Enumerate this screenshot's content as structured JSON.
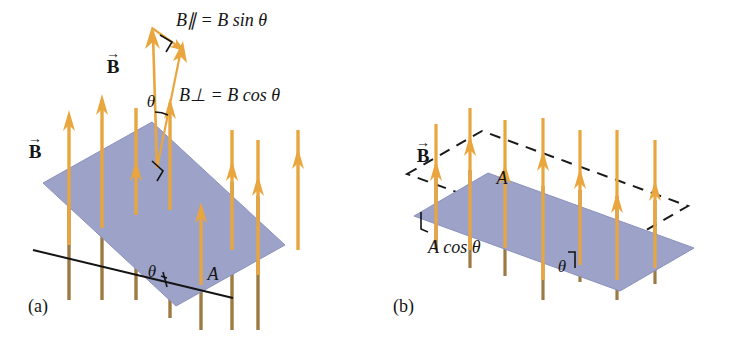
{
  "figure": {
    "background_color": "#ffffff",
    "panels": [
      {
        "id": "a",
        "caption": "(a)",
        "labels": {
          "field_vector": "B",
          "field_vector_plane": "B",
          "parallel_component": "B∥ = B sin θ",
          "perpendicular_component": "B⊥ = B cos θ",
          "angle_upper": "θ",
          "angle_lower": "θ",
          "area": "A"
        }
      },
      {
        "id": "b",
        "caption": "(b)",
        "labels": {
          "field_vector": "B",
          "area": "A",
          "projected_area": "A cos θ",
          "angle": "θ"
        }
      }
    ]
  },
  "colors": {
    "plane_fill": "#9DA2C8",
    "plane_fill_edge": "#8B91BD",
    "field_arrow": "#E9A63E",
    "field_arrow_behind": "#9C7A43",
    "vector_outline": "#E9A63E",
    "line_black": "#141414",
    "dashed_line": "#1A1A1A",
    "text": "#141414"
  },
  "geometry": {
    "panel_a_plane": "43,183 152,122 285,245 176,306",
    "panel_b_plane": "414,216 488,173 694,248 620,291",
    "panel_b_dashed_plane": "407,174 482,131 688,206 613,249",
    "reference_line_a": "33,250 233,298",
    "field_direction": "vertical-up",
    "arrow_count_a": 9,
    "arrow_count_b": 9
  },
  "symbols": {
    "theta": "θ",
    "parallel": "∥",
    "perp": "⊥",
    "equals": "=",
    "sin": "sin",
    "cos": "cos",
    "vector_arrow_overbar": "→"
  }
}
